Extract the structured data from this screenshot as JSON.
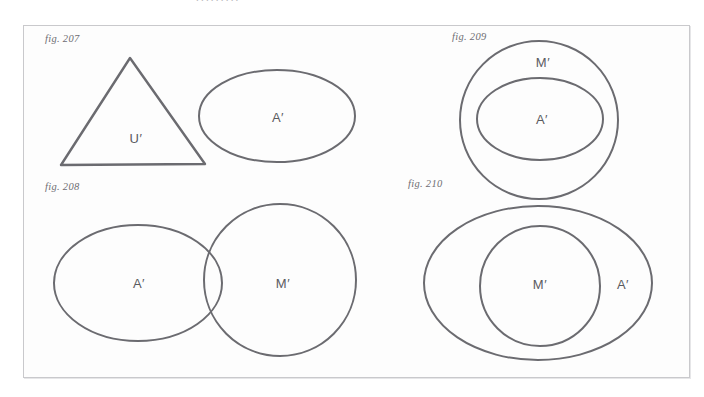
{
  "page": {
    "background_color": "#ffffff",
    "frame_border_color": "#c9c9cc",
    "stroke_color": "#6b6b70",
    "label_color": "#5a5a5f",
    "caption_color": "#6e6e73",
    "scan_remnant": "........."
  },
  "figures": [
    {
      "id": "fig-207",
      "caption": "fig. 207",
      "shapes": [
        {
          "name": "triangle-u-prime",
          "type": "triangle",
          "label": "U′"
        },
        {
          "name": "ellipse-a-prime",
          "type": "ellipse",
          "label": "A′"
        }
      ],
      "labels": [
        "U′",
        "A′"
      ]
    },
    {
      "id": "fig-208",
      "caption": "fig. 208",
      "shapes": [
        {
          "name": "ellipse-a-prime",
          "type": "ellipse",
          "label": "A′"
        },
        {
          "name": "circle-m-prime",
          "type": "circle",
          "label": "M′"
        }
      ],
      "labels": [
        "A′",
        "M′"
      ],
      "relation": "overlapping"
    },
    {
      "id": "fig-209",
      "caption": "fig. 209",
      "shapes": [
        {
          "name": "circle-m-prime",
          "type": "circle",
          "label": "M′"
        },
        {
          "name": "ellipse-a-prime",
          "type": "ellipse",
          "label": "A′"
        }
      ],
      "labels": [
        "M′",
        "A′"
      ],
      "relation": "nested"
    },
    {
      "id": "fig-210",
      "caption": "fig. 210",
      "shapes": [
        {
          "name": "ellipse-a-prime",
          "type": "ellipse",
          "label": "A′"
        },
        {
          "name": "circle-m-prime",
          "type": "circle",
          "label": "M′"
        }
      ],
      "labels": [
        "M′",
        "A′"
      ],
      "relation": "nested"
    }
  ],
  "captions": {
    "f207": "fig. 207",
    "f208": "fig. 208",
    "f209": "fig. 209",
    "f210": "fig. 210"
  },
  "set_labels": {
    "f207_u": "U′",
    "f207_a": "A′",
    "f208_a": "A′",
    "f208_m": "M′",
    "f209_m": "M′",
    "f209_a": "A′",
    "f210_m": "M′",
    "f210_a": "A′"
  }
}
